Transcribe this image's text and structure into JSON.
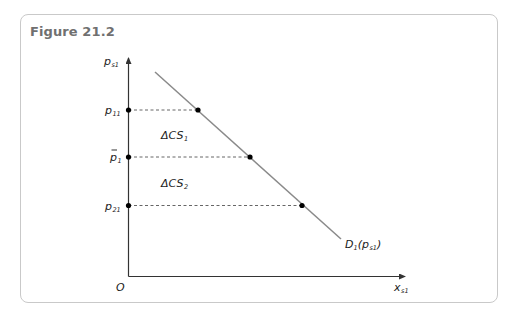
{
  "figure": {
    "title": "Figure 21.2"
  },
  "axes": {
    "y_label_main": "p",
    "y_label_sub": "s1",
    "x_label_main": "x",
    "x_label_sub": "s1",
    "origin_label": "O"
  },
  "price_levels": [
    {
      "label_main": "p",
      "label_sub": "11",
      "bar": false
    },
    {
      "label_main": "p",
      "label_sub": "1",
      "bar": true
    },
    {
      "label_main": "p",
      "label_sub": "21",
      "bar": false
    }
  ],
  "areas": [
    {
      "label_main": "ΔCS",
      "label_sub": "1"
    },
    {
      "label_main": "ΔCS",
      "label_sub": "2"
    }
  ],
  "demand_curve": {
    "label_main": "D",
    "label_sub": "1",
    "label_arg_open": "(",
    "label_arg_main": "p",
    "label_arg_sub": "s1",
    "label_arg_close": ")"
  },
  "colors": {
    "frame": "#c9c9c9",
    "title": "#707070",
    "axis": "#333333",
    "demand_line": "#8a8a8a",
    "dashed": "#555555",
    "dot": "#000000"
  }
}
